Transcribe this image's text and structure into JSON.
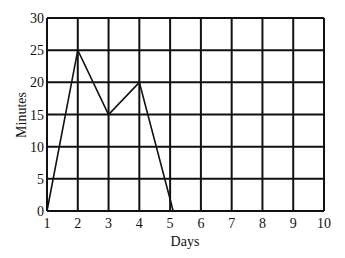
{
  "chart_data": {
    "type": "line",
    "title": "",
    "xlabel": "Days",
    "ylabel": "Minutes",
    "x": [
      1,
      2,
      3,
      4,
      5.1,
      6,
      7,
      8,
      9,
      10
    ],
    "series": [
      {
        "name": "Minutes",
        "values": [
          0,
          25,
          15,
          20,
          0,
          0,
          0,
          0,
          0,
          0
        ]
      }
    ],
    "xlim": [
      1,
      10
    ],
    "ylim": [
      0,
      30
    ],
    "xticks": [
      "1",
      "2",
      "3",
      "4",
      "5",
      "6",
      "7",
      "8",
      "9",
      "10"
    ],
    "yticks": [
      "0",
      "5",
      "10",
      "15",
      "20",
      "25",
      "30"
    ],
    "grid": true,
    "legend": null
  },
  "colors": {
    "line": "#111111",
    "grid": "#111111",
    "background": "#ffffff"
  }
}
